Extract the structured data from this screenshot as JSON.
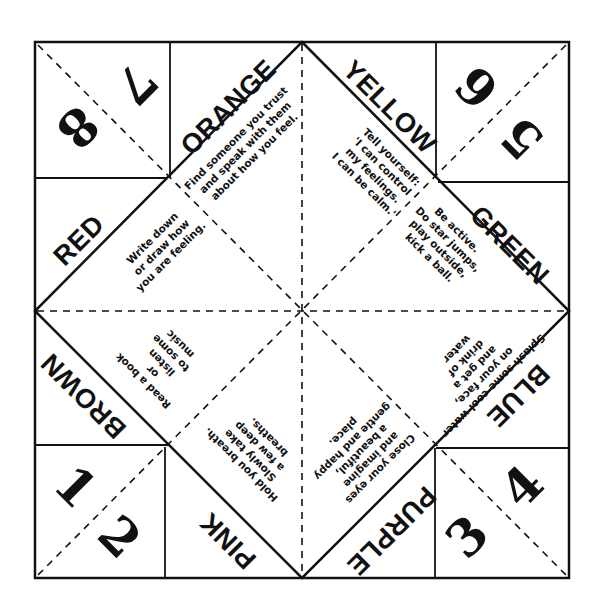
{
  "fortune_teller": {
    "numbers": {
      "n1": "1",
      "n2": "2",
      "n3": "3",
      "n4": "4",
      "n5": "5",
      "n6": "6",
      "n7": "7",
      "n8": "8"
    },
    "colors": {
      "orange": "ORANGE",
      "yellow": "YELLOW",
      "green": "GREEN",
      "blue": "BLUE",
      "purple": "PURPLE",
      "pink": "PINK",
      "brown": "BROWN",
      "red": "RED"
    },
    "fortunes": {
      "orange": "Find someone you trust\nand speak with them\nabout how you feel.",
      "yellow": "Tell yourself:\n'I can control\nmy feelings.\nI can be calm.'",
      "green": "Be active.\nDo star jumps,\nplay outside,\nkick a ball.",
      "blue": "Splash some cool water\non your face,\nand get a\ndrink of\nwater",
      "purple": "Close your eyes\nand imagine\na beautiful,\ngentle and happy\nplace.",
      "pink": "Hold you breath.\nSlowly take\na few deep\nbreaths.",
      "brown": "Read a book\nor\nlisten\nto some\nmusic",
      "red": "Write down\nor draw how\nyou are feeling."
    },
    "line_color": "#111111",
    "background": "#ffffff"
  }
}
